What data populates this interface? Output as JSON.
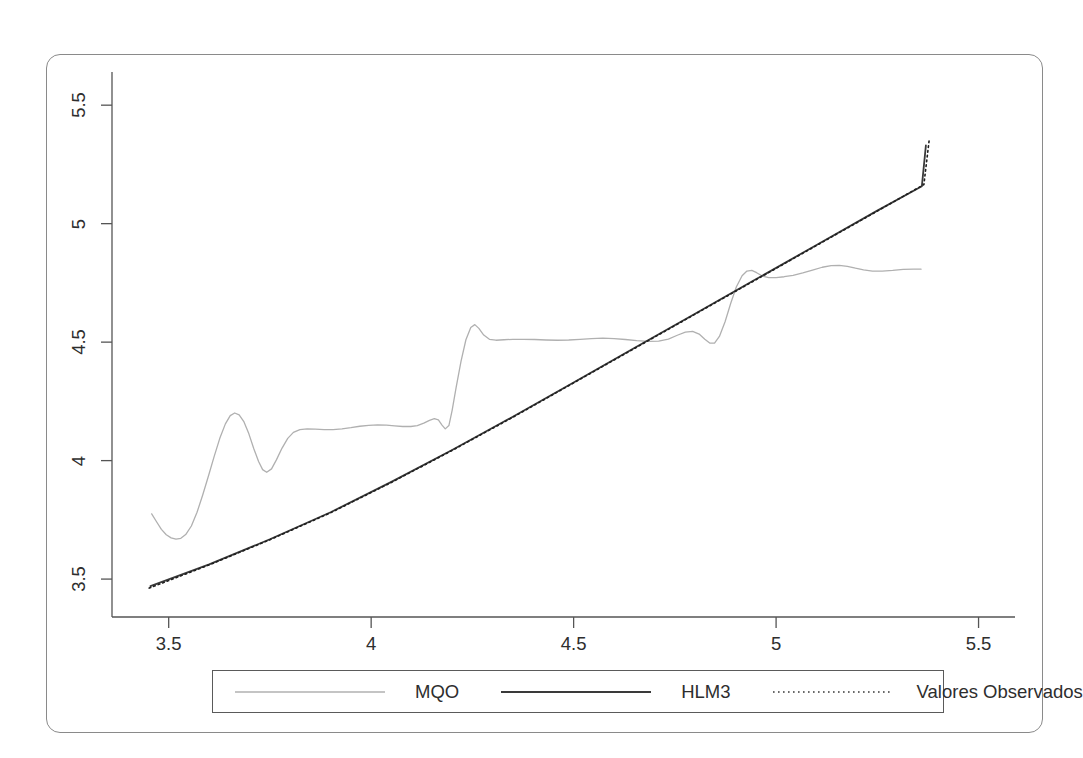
{
  "figure": {
    "background_color": "#ffffff",
    "frame_color": "#8a8a8a",
    "plot_area": {
      "x": 112,
      "y": 72,
      "width": 903,
      "height": 545
    }
  },
  "chart_data": {
    "type": "line",
    "title": "",
    "subtitle": "",
    "xlabel": "",
    "ylabel": "",
    "xlim": [
      3.36,
      5.59
    ],
    "ylim": [
      3.34,
      5.64
    ],
    "xticks": [
      "3.5",
      "4",
      "4.5",
      "5",
      "5.5"
    ],
    "xtick_values": [
      3.5,
      4,
      4.5,
      5,
      5.5
    ],
    "yticks": [
      "3.5",
      "4",
      "4.5",
      "5",
      "5.5"
    ],
    "ytick_values": [
      3.5,
      4,
      4.5,
      5,
      5.5
    ],
    "grid": false,
    "legend_position": "bottom-outside",
    "series": [
      {
        "name": "MQO",
        "color": "#b0b0b0",
        "style": "solid",
        "width": 1.3,
        "points": [
          [
            3.458,
            3.775
          ],
          [
            3.47,
            3.742
          ],
          [
            3.482,
            3.71
          ],
          [
            3.494,
            3.687
          ],
          [
            3.506,
            3.674
          ],
          [
            3.518,
            3.669
          ],
          [
            3.53,
            3.672
          ],
          [
            3.542,
            3.688
          ],
          [
            3.556,
            3.724
          ],
          [
            3.57,
            3.782
          ],
          [
            3.584,
            3.855
          ],
          [
            3.598,
            3.934
          ],
          [
            3.612,
            4.016
          ],
          [
            3.626,
            4.093
          ],
          [
            3.64,
            4.155
          ],
          [
            3.652,
            4.19
          ],
          [
            3.663,
            4.201
          ],
          [
            3.674,
            4.193
          ],
          [
            3.686,
            4.163
          ],
          [
            3.698,
            4.113
          ],
          [
            3.71,
            4.051
          ],
          [
            3.722,
            3.996
          ],
          [
            3.732,
            3.962
          ],
          [
            3.742,
            3.951
          ],
          [
            3.754,
            3.965
          ],
          [
            3.766,
            4.003
          ],
          [
            3.78,
            4.053
          ],
          [
            3.794,
            4.094
          ],
          [
            3.808,
            4.119
          ],
          [
            3.824,
            4.131
          ],
          [
            3.842,
            4.134
          ],
          [
            3.862,
            4.133
          ],
          [
            3.884,
            4.131
          ],
          [
            3.906,
            4.131
          ],
          [
            3.928,
            4.134
          ],
          [
            3.95,
            4.139
          ],
          [
            3.972,
            4.145
          ],
          [
            3.994,
            4.149
          ],
          [
            4.016,
            4.151
          ],
          [
            4.038,
            4.15
          ],
          [
            4.058,
            4.147
          ],
          [
            4.078,
            4.144
          ],
          [
            4.098,
            4.144
          ],
          [
            4.114,
            4.148
          ],
          [
            4.13,
            4.158
          ],
          [
            4.144,
            4.17
          ],
          [
            4.156,
            4.177
          ],
          [
            4.166,
            4.172
          ],
          [
            4.175,
            4.15
          ],
          [
            4.183,
            4.134
          ],
          [
            4.192,
            4.148
          ],
          [
            4.2,
            4.212
          ],
          [
            4.21,
            4.31
          ],
          [
            4.222,
            4.42
          ],
          [
            4.234,
            4.51
          ],
          [
            4.246,
            4.562
          ],
          [
            4.256,
            4.574
          ],
          [
            4.266,
            4.558
          ],
          [
            4.278,
            4.53
          ],
          [
            4.292,
            4.512
          ],
          [
            4.308,
            4.508
          ],
          [
            4.328,
            4.51
          ],
          [
            4.35,
            4.512
          ],
          [
            4.376,
            4.512
          ],
          [
            4.404,
            4.511
          ],
          [
            4.432,
            4.509
          ],
          [
            4.46,
            4.508
          ],
          [
            4.488,
            4.509
          ],
          [
            4.516,
            4.512
          ],
          [
            4.544,
            4.515
          ],
          [
            4.572,
            4.517
          ],
          [
            4.6,
            4.515
          ],
          [
            4.628,
            4.511
          ],
          [
            4.656,
            4.506
          ],
          [
            4.684,
            4.503
          ],
          [
            4.71,
            4.504
          ],
          [
            4.734,
            4.513
          ],
          [
            4.756,
            4.529
          ],
          [
            4.776,
            4.542
          ],
          [
            4.794,
            4.545
          ],
          [
            4.81,
            4.534
          ],
          [
            4.824,
            4.512
          ],
          [
            4.836,
            4.496
          ],
          [
            4.848,
            4.496
          ],
          [
            4.86,
            4.524
          ],
          [
            4.874,
            4.586
          ],
          [
            4.888,
            4.664
          ],
          [
            4.902,
            4.734
          ],
          [
            4.916,
            4.78
          ],
          [
            4.928,
            4.8
          ],
          [
            4.94,
            4.803
          ],
          [
            4.952,
            4.793
          ],
          [
            4.966,
            4.779
          ],
          [
            4.982,
            4.772
          ],
          [
            5.0,
            4.772
          ],
          [
            5.02,
            4.776
          ],
          [
            5.042,
            4.782
          ],
          [
            5.066,
            4.792
          ],
          [
            5.09,
            4.804
          ],
          [
            5.114,
            4.816
          ],
          [
            5.136,
            4.823
          ],
          [
            5.156,
            4.824
          ],
          [
            5.176,
            4.82
          ],
          [
            5.196,
            4.812
          ],
          [
            5.216,
            4.805
          ],
          [
            5.238,
            4.8
          ],
          [
            5.262,
            4.8
          ],
          [
            5.288,
            4.803
          ],
          [
            5.314,
            4.807
          ],
          [
            5.34,
            4.808
          ],
          [
            5.358,
            4.808
          ]
        ]
      },
      {
        "name": "HLM3",
        "color": "#3a3a3a",
        "style": "solid",
        "width": 1.8,
        "points": [
          [
            3.455,
            3.47
          ],
          [
            3.6,
            3.562
          ],
          [
            3.75,
            3.668
          ],
          [
            3.9,
            3.782
          ],
          [
            4.05,
            3.91
          ],
          [
            4.2,
            4.045
          ],
          [
            4.35,
            4.185
          ],
          [
            4.5,
            4.33
          ],
          [
            4.65,
            4.475
          ],
          [
            4.8,
            4.62
          ],
          [
            4.95,
            4.765
          ],
          [
            5.1,
            4.91
          ],
          [
            5.25,
            5.055
          ],
          [
            5.36,
            5.158
          ],
          [
            5.37,
            5.33
          ]
        ]
      },
      {
        "name": "Valores Observados",
        "color": "#1f1f1f",
        "style": "dotted",
        "width": 1.6,
        "points": [
          [
            3.452,
            3.462
          ],
          [
            3.6,
            3.56
          ],
          [
            3.75,
            3.666
          ],
          [
            3.9,
            3.78
          ],
          [
            4.05,
            3.908
          ],
          [
            4.2,
            4.043
          ],
          [
            4.35,
            4.183
          ],
          [
            4.5,
            4.328
          ],
          [
            4.65,
            4.473
          ],
          [
            4.8,
            4.618
          ],
          [
            4.95,
            4.763
          ],
          [
            5.1,
            4.908
          ],
          [
            5.25,
            5.053
          ],
          [
            5.365,
            5.165
          ],
          [
            5.378,
            5.352
          ]
        ]
      }
    ]
  },
  "legend": {
    "entries": [
      {
        "label": "MQO",
        "color": "#b0b0b0",
        "style": "solid",
        "width": 1.4
      },
      {
        "label": "HLM3",
        "color": "#3a3a3a",
        "style": "solid",
        "width": 2.1
      },
      {
        "label": "Valores Observados",
        "color": "#3a3a3a",
        "style": "dotted",
        "width": 1.6
      }
    ]
  }
}
